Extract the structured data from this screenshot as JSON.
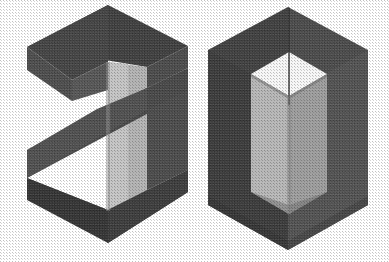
{
  "image": {
    "kind": "isometric-3d-logo",
    "alt_text": "20",
    "width": 389,
    "height": 262,
    "background_color": "#ffffff",
    "texture": "halftone-print-grain"
  },
  "palette": {
    "background": "#ffffff",
    "top_face_dark": "#3c3c3c",
    "top_face_dark_2": "#474747",
    "left_face_dark": "#3a3a3a",
    "right_face_mid": "#565656",
    "band_mid": "#4e4e4e",
    "band_mid_2": "#5a5a5a",
    "light_face": "#b4b4b4",
    "light_face_2": "#a0a0a0",
    "lightest_face": "#cfcfcf",
    "highlight_white": "#f6f6f6",
    "shadow_edge": "#2e2e2e"
  },
  "glyphs": [
    {
      "id": "glyph-two",
      "character": "2",
      "label": "numeral-two",
      "description": "Z-shaped isometric ribbon forming the digit 2",
      "bbox": {
        "x": 26,
        "y": 5,
        "width": 162,
        "height": 240
      },
      "faces": [
        {
          "name": "top-upper-slab-top",
          "tone": "#3c3c3c"
        },
        {
          "name": "top-upper-slab-front",
          "tone": "#4e4e4e"
        },
        {
          "name": "vertical-pillar-light",
          "tone": "#b4b4b4"
        },
        {
          "name": "vertical-pillar-lit",
          "tone": "#cfcfcf"
        },
        {
          "name": "diagonal-band-top",
          "tone": "#5a5a5a"
        },
        {
          "name": "diagonal-band-front",
          "tone": "#474747"
        },
        {
          "name": "bottom-slab-top",
          "tone": "#3a3a3a"
        },
        {
          "name": "bottom-slab-front",
          "tone": "#333333"
        }
      ]
    },
    {
      "id": "glyph-zero",
      "character": "0",
      "label": "numeral-zero",
      "description": "Hexagonal isometric block with a square shaft cut through it forming the digit 0",
      "bbox": {
        "x": 207,
        "y": 7,
        "width": 161,
        "height": 244
      },
      "faces": [
        {
          "name": "outer-top-left",
          "tone": "#3f3f3f"
        },
        {
          "name": "outer-top-right",
          "tone": "#484848"
        },
        {
          "name": "outer-side-left",
          "tone": "#3a3a3a"
        },
        {
          "name": "outer-side-right",
          "tone": "#555555"
        },
        {
          "name": "outer-bottom-left",
          "tone": "#353535"
        },
        {
          "name": "outer-bottom-right",
          "tone": "#3d3d3d"
        },
        {
          "name": "inner-shaft-top",
          "tone": "#f6f6f6"
        },
        {
          "name": "inner-shaft-left",
          "tone": "#b6b6b6"
        },
        {
          "name": "inner-shaft-right",
          "tone": "#9c9c9c"
        }
      ]
    }
  ]
}
